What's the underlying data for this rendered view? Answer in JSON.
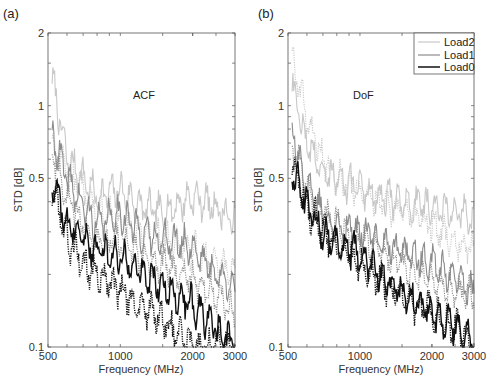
{
  "figure": {
    "panels": [
      {
        "panel_label": "(a)",
        "title": "ACF",
        "xlabel": "Frequency (MHz)",
        "ylabel": "STD [dB]"
      },
      {
        "panel_label": "(b)",
        "title": "DoF",
        "xlabel": "Frequency (MHz)",
        "ylabel": "STD [dB]"
      }
    ],
    "legend": [
      {
        "label": "Load2",
        "color": "#c8c8c8"
      },
      {
        "label": "Load1",
        "color": "#8c8c8c"
      },
      {
        "label": "Load0",
        "color": "#111111"
      }
    ]
  },
  "chart_data": [
    {
      "type": "line",
      "panel_label": "(a)",
      "title": "ACF",
      "xlabel": "Frequency (MHz)",
      "ylabel": "STD [dB]",
      "xscale": "log",
      "yscale": "log",
      "xlim": [
        500,
        3000
      ],
      "ylim": [
        0.1,
        2
      ],
      "xticks": [
        500,
        1000,
        2000,
        3000
      ],
      "yticks": [
        0.1,
        0.5,
        1,
        2
      ],
      "legend_position": "none",
      "series": [
        {
          "name": "Load2",
          "style": "solid",
          "color": "#c8c8c8",
          "x": [
            520,
            600,
            700,
            800,
            1000,
            1200,
            1500,
            2000,
            2500,
            3000
          ],
          "values": [
            1.3,
            0.6,
            0.5,
            0.42,
            0.45,
            0.38,
            0.36,
            0.42,
            0.38,
            0.33
          ]
        },
        {
          "name": "Load2",
          "style": "dotted",
          "color": "#c8c8c8",
          "x": [
            520,
            600,
            700,
            800,
            1000,
            1200,
            1500,
            2000,
            2500,
            3000
          ],
          "values": [
            0.7,
            0.55,
            0.45,
            0.38,
            0.32,
            0.3,
            0.28,
            0.25,
            0.22,
            0.2
          ]
        },
        {
          "name": "Load1",
          "style": "solid",
          "color": "#8c8c8c",
          "x": [
            520,
            600,
            700,
            800,
            1000,
            1200,
            1500,
            2000,
            2500,
            3000
          ],
          "values": [
            0.75,
            0.5,
            0.38,
            0.32,
            0.36,
            0.3,
            0.28,
            0.26,
            0.2,
            0.18
          ]
        },
        {
          "name": "Load1",
          "style": "dotted",
          "color": "#8c8c8c",
          "x": [
            520,
            600,
            700,
            800,
            1000,
            1200,
            1500,
            2000,
            2500,
            3000
          ],
          "values": [
            0.65,
            0.42,
            0.33,
            0.28,
            0.27,
            0.24,
            0.22,
            0.19,
            0.16,
            0.14
          ]
        },
        {
          "name": "Load0",
          "style": "solid",
          "color": "#111111",
          "x": [
            520,
            600,
            700,
            800,
            1000,
            1200,
            1500,
            2000,
            2500,
            3000
          ],
          "values": [
            0.5,
            0.32,
            0.28,
            0.25,
            0.24,
            0.21,
            0.18,
            0.15,
            0.12,
            0.1
          ]
        },
        {
          "name": "Load0",
          "style": "dotted",
          "color": "#111111",
          "x": [
            520,
            600,
            700,
            800,
            1000,
            1200,
            1500,
            2000,
            2500,
            3000
          ],
          "values": [
            0.45,
            0.28,
            0.22,
            0.2,
            0.17,
            0.15,
            0.13,
            0.1,
            0.1,
            0.1
          ]
        }
      ]
    },
    {
      "type": "line",
      "panel_label": "(b)",
      "title": "DoF",
      "xlabel": "Frequency (MHz)",
      "ylabel": "STD [dB]",
      "xscale": "log",
      "yscale": "log",
      "xlim": [
        500,
        3000
      ],
      "ylim": [
        0.1,
        2
      ],
      "xticks": [
        500,
        1000,
        2000,
        3000
      ],
      "yticks": [
        0.1,
        0.5,
        1,
        2
      ],
      "legend_position": "upper right",
      "series": [
        {
          "name": "Load2",
          "style": "solid",
          "color": "#c8c8c8",
          "x": [
            520,
            600,
            700,
            800,
            1000,
            1200,
            1500,
            2000,
            2500,
            3000
          ],
          "values": [
            1.2,
            0.7,
            0.55,
            0.5,
            0.45,
            0.42,
            0.4,
            0.38,
            0.36,
            0.34
          ]
        },
        {
          "name": "Load2",
          "style": "dotted",
          "color": "#c8c8c8",
          "x": [
            520,
            600,
            700,
            800,
            1000,
            1200,
            1500,
            2000,
            2500,
            3000
          ],
          "values": [
            1.6,
            0.9,
            0.6,
            0.5,
            0.45,
            0.4,
            0.36,
            0.32,
            0.28,
            0.25
          ]
        },
        {
          "name": "Load1",
          "style": "solid",
          "color": "#8c8c8c",
          "x": [
            520,
            600,
            700,
            800,
            1000,
            1200,
            1500,
            2000,
            2500,
            3000
          ],
          "values": [
            0.8,
            0.45,
            0.36,
            0.32,
            0.3,
            0.28,
            0.25,
            0.22,
            0.19,
            0.17
          ]
        },
        {
          "name": "Load1",
          "style": "dotted",
          "color": "#8c8c8c",
          "x": [
            520,
            600,
            700,
            800,
            1000,
            1200,
            1500,
            2000,
            2500,
            3000
          ],
          "values": [
            0.7,
            0.45,
            0.36,
            0.32,
            0.28,
            0.25,
            0.22,
            0.19,
            0.17,
            0.16
          ]
        },
        {
          "name": "Load0",
          "style": "solid",
          "color": "#111111",
          "x": [
            520,
            600,
            700,
            800,
            1000,
            1200,
            1500,
            2000,
            2500,
            3000
          ],
          "values": [
            0.55,
            0.38,
            0.3,
            0.27,
            0.24,
            0.2,
            0.17,
            0.14,
            0.12,
            0.1
          ]
        },
        {
          "name": "Load0",
          "style": "dotted",
          "color": "#111111",
          "x": [
            520,
            600,
            700,
            800,
            1000,
            1200,
            1500,
            2000,
            2500,
            3000
          ],
          "values": [
            0.6,
            0.38,
            0.3,
            0.26,
            0.22,
            0.19,
            0.16,
            0.14,
            0.12,
            0.1
          ]
        }
      ]
    }
  ]
}
